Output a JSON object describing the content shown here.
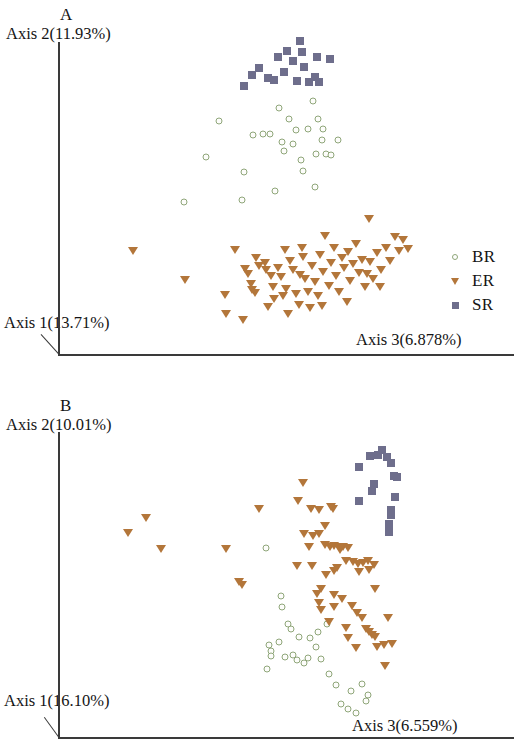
{
  "figure": {
    "type": "scientific-figure",
    "panel_count": 2,
    "colors": {
      "BR": "#8fa679",
      "ER": "#b3763a",
      "SR": "#6e6e8c",
      "axis": "#3a3a3a",
      "background": "#ffffff"
    }
  },
  "legend": {
    "entries": [
      {
        "label": "BR",
        "marker": "open-circle",
        "color": "#8fa679"
      },
      {
        "label": "ER",
        "marker": "filled-down-triangle",
        "color": "#b3763a"
      },
      {
        "label": "SR",
        "marker": "filled-square",
        "color": "#6e6e8c"
      }
    ]
  },
  "panel_a": {
    "letter": "A",
    "axis_y": "Axis 2(11.93%)",
    "axis_x": "Axis 1(13.71%)",
    "axis_z": "Axis 3(6.878%)"
  },
  "panel_b": {
    "letter": "B",
    "axis_y": "Axis 2(10.01%)",
    "axis_x": "Axis 1(16.10%)",
    "axis_z": "Axis 3(6.559%)"
  },
  "chart_data": [
    {
      "type": "scatter",
      "panel": "A",
      "title": "A",
      "xlabel": "Axis 3(6.878%)",
      "ylabel": "Axis 2(11.93%)",
      "zlabel": "Axis 1(13.71%)",
      "projection": "3d-pcoa",
      "grid": false,
      "legend_position": "right",
      "xlim": [
        0,
        100
      ],
      "ylim": [
        0,
        100
      ],
      "series": [
        {
          "name": "BR",
          "marker": "open-circle",
          "color": "#8fa679",
          "points": [
            [
              40.2,
              71.5
            ],
            [
              36.8,
              60.3
            ],
            [
              47.1,
              55.6
            ],
            [
              49.5,
              67.1
            ],
            [
              52.2,
              67.4
            ],
            [
              54.0,
              67.5
            ],
            [
              57.3,
              65.1
            ],
            [
              61.0,
              68.8
            ],
            [
              59.2,
              72.3
            ],
            [
              56.6,
              75.5
            ],
            [
              65.6,
              77.8
            ],
            [
              67.0,
              72.2
            ],
            [
              64.3,
              69.1
            ],
            [
              68.0,
              65.6
            ],
            [
              66.6,
              61.1
            ],
            [
              69.1,
              61.3
            ],
            [
              70.6,
              61.0
            ],
            [
              72.4,
              65.5
            ],
            [
              62.4,
              59.4
            ],
            [
              57.8,
              62.1
            ],
            [
              63.0,
              56.0
            ],
            [
              66.3,
              50.9
            ],
            [
              46.5,
              47.0
            ],
            [
              30.8,
              46.2
            ],
            [
              55.3,
              49.7
            ],
            [
              68.4,
              69.0
            ],
            [
              60.3,
              64.4
            ]
          ]
        },
        {
          "name": "ER",
          "marker": "filled-down-triangle",
          "color": "#b3763a",
          "points": [
            [
              17.1,
              30.9
            ],
            [
              31.2,
              22.0
            ],
            [
              41.9,
              17.3
            ],
            [
              42.2,
              11.2
            ],
            [
              44.5,
              31.2
            ],
            [
              47.3,
              25.2
            ],
            [
              48.0,
              23.8
            ],
            [
              48.9,
              20.6
            ],
            [
              49.3,
              18.6
            ],
            [
              50.1,
              17.9
            ],
            [
              51.2,
              26.1
            ],
            [
              52.6,
              27.2
            ],
            [
              53.0,
              24.9
            ],
            [
              54.2,
              23.2
            ],
            [
              54.8,
              19.8
            ],
            [
              55.1,
              15.9
            ],
            [
              56.2,
              25.7
            ],
            [
              57.0,
              22.9
            ],
            [
              58.0,
              31.2
            ],
            [
              58.4,
              19.2
            ],
            [
              59.5,
              27.8
            ],
            [
              60.3,
              25.0
            ],
            [
              61.2,
              17.5
            ],
            [
              61.9,
              14.0
            ],
            [
              62.2,
              23.5
            ],
            [
              63.1,
              29.0
            ],
            [
              63.6,
              22.1
            ],
            [
              64.4,
              18.1
            ],
            [
              64.8,
              13.0
            ],
            [
              65.4,
              26.4
            ],
            [
              66.1,
              21.4
            ],
            [
              66.9,
              16.9
            ],
            [
              67.6,
              29.6
            ],
            [
              68.4,
              24.4
            ],
            [
              69.0,
              35.6
            ],
            [
              69.9,
              20.1
            ],
            [
              70.6,
              27.1
            ],
            [
              71.3,
              32.0
            ],
            [
              72.0,
              23.2
            ],
            [
              72.7,
              18.2
            ],
            [
              73.5,
              28.8
            ],
            [
              74.1,
              25.6
            ],
            [
              75.0,
              30.5
            ],
            [
              75.8,
              21.7
            ],
            [
              76.4,
              26.9
            ],
            [
              77.2,
              33.1
            ],
            [
              78.0,
              24.0
            ],
            [
              78.8,
              28.2
            ],
            [
              79.6,
              19.6
            ],
            [
              80.4,
              23.7
            ],
            [
              81.2,
              27.4
            ],
            [
              82.0,
              22.3
            ],
            [
              83.1,
              30.2
            ],
            [
              84.0,
              25.1
            ],
            [
              85.4,
              31.8
            ],
            [
              86.6,
              27.7
            ],
            [
              87.8,
              35.4
            ],
            [
              88.9,
              31.0
            ],
            [
              90.1,
              34.5
            ],
            [
              91.3,
              31.5
            ],
            [
              80.7,
              40.9
            ],
            [
              83.8,
              19.8
            ],
            [
              46.8,
              9.3
            ],
            [
              53.6,
              13.4
            ],
            [
              59.0,
              11.1
            ],
            [
              50.4,
              28.9
            ],
            [
              57.6,
              17.0
            ],
            [
              62.8,
              31.9
            ],
            [
              68.0,
              13.6
            ],
            [
              74.8,
              14.9
            ]
          ]
        },
        {
          "name": "SR",
          "marker": "filled-square",
          "color": "#6e6e8c",
          "points": [
            [
              47.0,
              82.4
            ],
            [
              49.2,
              85.8
            ],
            [
              51.0,
              88.0
            ],
            [
              53.4,
              85.1
            ],
            [
              56.2,
              91.5
            ],
            [
              57.8,
              87.0
            ],
            [
              58.6,
              93.4
            ],
            [
              60.4,
              90.2
            ],
            [
              62.1,
              96.6
            ],
            [
              62.6,
              93.0
            ],
            [
              63.2,
              88.5
            ],
            [
              64.7,
              83.6
            ],
            [
              66.1,
              85.2
            ],
            [
              66.8,
              91.7
            ],
            [
              67.4,
              83.9
            ],
            [
              70.2,
              90.8
            ],
            [
              61.4,
              84.0
            ],
            [
              55.0,
              84.5
            ]
          ]
        }
      ]
    },
    {
      "type": "scatter",
      "panel": "B",
      "title": "B",
      "xlabel": "Axis 3(6.559%)",
      "ylabel": "Axis 2(10.01%)",
      "zlabel": "Axis 1(16.10%)",
      "projection": "3d-pcoa",
      "grid": false,
      "legend_position": "right",
      "xlim": [
        0,
        100
      ],
      "ylim": [
        0,
        100
      ],
      "series": [
        {
          "name": "BR",
          "marker": "open-circle",
          "color": "#8fa679",
          "points": [
            [
              52.7,
              59.2
            ],
            [
              56.6,
              44.0
            ],
            [
              56.8,
              40.5
            ],
            [
              59.2,
              33.6
            ],
            [
              53.5,
              28.6
            ],
            [
              56.1,
              29.7
            ],
            [
              54.0,
              26.7
            ],
            [
              53.9,
              25.1
            ],
            [
              57.6,
              24.7
            ],
            [
              59.8,
              25.5
            ],
            [
              60.8,
              23.9
            ],
            [
              62.6,
              22.9
            ],
            [
              63.6,
              24.5
            ],
            [
              65.8,
              28.0
            ],
            [
              67.2,
              24.3
            ],
            [
              64.2,
              30.7
            ],
            [
              52.8,
              21.2
            ],
            [
              69.2,
              19.4
            ],
            [
              71.0,
              15.9
            ],
            [
              74.9,
              14.3
            ],
            [
              77.8,
              16.2
            ],
            [
              79.4,
              13.0
            ],
            [
              72.4,
              10.2
            ],
            [
              74.1,
              8.6
            ],
            [
              76.2,
              7.1
            ],
            [
              79.0,
              11.0
            ],
            [
              68.6,
              35.2
            ],
            [
              58.4,
              35.1
            ],
            [
              61.4,
              31.0
            ],
            [
              66.3,
              32.6
            ]
          ]
        },
        {
          "name": "ER",
          "marker": "filled-down-triangle",
          "color": "#b3763a",
          "points": [
            [
              16.4,
              63.7
            ],
            [
              21.0,
              68.5
            ],
            [
              24.9,
              58.9
            ],
            [
              42.0,
              58.9
            ],
            [
              50.9,
              71.4
            ],
            [
              46.4,
              47.5
            ],
            [
              62.4,
              79.5
            ],
            [
              61.1,
              74.0
            ],
            [
              64.5,
              71.5
            ],
            [
              66.5,
              71.2
            ],
            [
              70.2,
              71.3
            ],
            [
              68.1,
              66.0
            ],
            [
              62.7,
              63.6
            ],
            [
              64.9,
              62.8
            ],
            [
              66.6,
              63.5
            ],
            [
              63.9,
              59.5
            ],
            [
              68.2,
              60.2
            ],
            [
              69.4,
              59.4
            ],
            [
              70.6,
              59.6
            ],
            [
              71.8,
              59.4
            ],
            [
              73.0,
              59.5
            ],
            [
              74.2,
              59.2
            ],
            [
              73.8,
              55.0
            ],
            [
              75.4,
              54.6
            ],
            [
              76.8,
              54.2
            ],
            [
              78.2,
              54.4
            ],
            [
              79.6,
              55.0
            ],
            [
              81.0,
              53.8
            ],
            [
              60.9,
              53.4
            ],
            [
              64.7,
              53.6
            ],
            [
              71.4,
              52.9
            ],
            [
              77.2,
              51.6
            ],
            [
              79.8,
              52.2
            ],
            [
              68.4,
              50.6
            ],
            [
              45.6,
              48.4
            ],
            [
              67.0,
              46.1
            ],
            [
              70.4,
              44.4
            ],
            [
              72.6,
              43.0
            ],
            [
              81.4,
              46.3
            ],
            [
              66.1,
              44.5
            ],
            [
              66.6,
              41.9
            ],
            [
              67.0,
              39.6
            ],
            [
              75.2,
              41.0
            ],
            [
              70.4,
              40.6
            ],
            [
              76.6,
              38.6
            ],
            [
              77.8,
              37.0
            ],
            [
              84.8,
              37.0
            ],
            [
              69.1,
              35.8
            ],
            [
              73.7,
              34.0
            ],
            [
              79.0,
              33.6
            ],
            [
              79.8,
              32.6
            ],
            [
              80.6,
              31.9
            ],
            [
              81.2,
              31.0
            ],
            [
              74.1,
              30.8
            ],
            [
              83.6,
              28.6
            ],
            [
              85.8,
              29.0
            ],
            [
              76.2,
              27.6
            ],
            [
              81.9,
              27.9
            ],
            [
              84.0,
              22.0
            ],
            [
              72.0,
              58.6
            ],
            [
              69.8,
              72.0
            ],
            [
              70.4,
              52.0
            ]
          ]
        },
        {
          "name": "SR",
          "marker": "filled-square",
          "color": "#6e6e8c",
          "points": [
            [
              79.9,
              87.9
            ],
            [
              82.2,
              88.4
            ],
            [
              83.1,
              90.0
            ],
            [
              84.4,
              87.6
            ],
            [
              85.6,
              85.9
            ],
            [
              77.0,
              84.5
            ],
            [
              86.2,
              81.9
            ],
            [
              87.0,
              81.3
            ],
            [
              81.0,
              79.3
            ],
            [
              80.6,
              77.2
            ],
            [
              86.7,
              75.2
            ],
            [
              77.2,
              74.0
            ],
            [
              85.4,
              71.0
            ],
            [
              85.6,
              69.4
            ],
            [
              85.0,
              66.6
            ],
            [
              84.9,
              64.2
            ]
          ]
        }
      ]
    }
  ]
}
